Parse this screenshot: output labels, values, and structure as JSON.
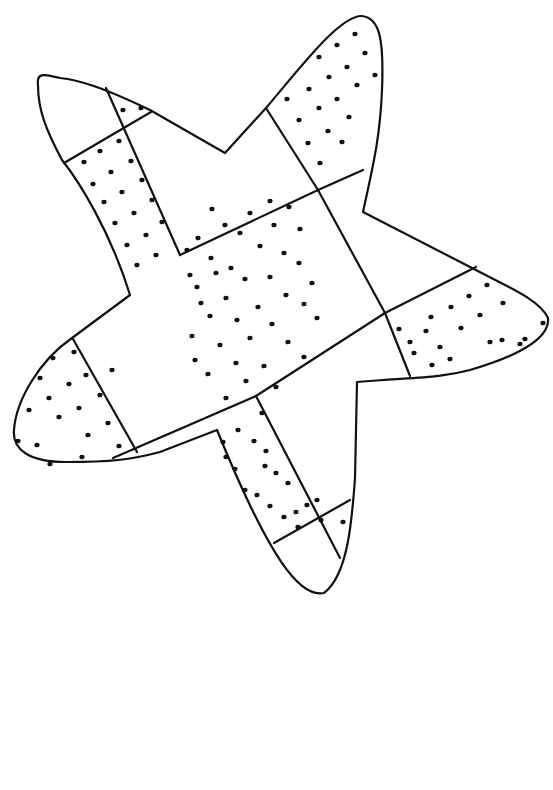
{
  "page": {
    "background": "#ffffff",
    "ink_color": "#111111",
    "width": 553,
    "height": 790
  },
  "drawing": {
    "subject": "star-shaped bandage coloring page",
    "outline": "M 38 85 C 36 70, 48 76, 60 78 C 78 80, 100 86, 150 110 L 225 153 L 266 108 C 300 68, 340 15, 362 16 C 380 18, 384 40, 382 90 C 380 140, 372 170, 363 212 L 472 268 C 510 288, 540 300, 548 318 C 550 336, 525 354, 470 370 C 440 378, 420 377, 357 382 L 355 478 C 352 520, 348 575, 324 593 C 300 598, 270 560, 217 430 L 160 452 C 130 460, 110 462, 66 462 C 30 462, 12 450, 14 430 C 16 400, 40 360, 72 338 L 130 295 C 110 230, 78 180, 62 160 C 46 130, 38 110, 38 85 Z",
    "segments": [
      "M 106 88 L 180 255",
      "M 64 163 L 151 112",
      "M 180 255 L 318 190",
      "M 318 190 L 363 170",
      "M 266 108 L 318 190",
      "M 318 190 L 385 313",
      "M 385 313 L 410 376",
      "M 385 313 L 476 267",
      "M 73 339 L 137 452",
      "M 113 458 L 256 396",
      "M 256 396 L 385 313",
      "M 256 396 L 340 558",
      "M 274 543 L 350 500"
    ],
    "dots": [
      [
        123,
        110
      ],
      [
        141,
        108
      ],
      [
        119,
        141
      ],
      [
        100,
        151
      ],
      [
        84,
        162
      ],
      [
        131,
        161
      ],
      [
        111,
        172
      ],
      [
        93,
        184
      ],
      [
        142,
        180
      ],
      [
        122,
        192
      ],
      [
        104,
        202
      ],
      [
        152,
        200
      ],
      [
        134,
        213
      ],
      [
        115,
        223
      ],
      [
        162,
        222
      ],
      [
        146,
        235
      ],
      [
        127,
        245
      ],
      [
        156,
        255
      ],
      [
        137,
        265
      ],
      [
        355,
        34
      ],
      [
        337,
        45
      ],
      [
        365,
        53
      ],
      [
        319,
        57
      ],
      [
        347,
        67
      ],
      [
        375,
        75
      ],
      [
        329,
        77
      ],
      [
        357,
        85
      ],
      [
        309,
        89
      ],
      [
        337,
        99
      ],
      [
        287,
        99
      ],
      [
        319,
        108
      ],
      [
        349,
        117
      ],
      [
        299,
        120
      ],
      [
        328,
        131
      ],
      [
        342,
        142
      ],
      [
        308,
        143
      ],
      [
        320,
        163
      ],
      [
        270,
        201
      ],
      [
        212,
        209
      ],
      [
        289,
        207
      ],
      [
        250,
        213
      ],
      [
        225,
        225
      ],
      [
        274,
        225
      ],
      [
        300,
        229
      ],
      [
        198,
        238
      ],
      [
        240,
        233
      ],
      [
        260,
        246
      ],
      [
        284,
        253
      ],
      [
        211,
        258
      ],
      [
        231,
        268
      ],
      [
        187,
        250
      ],
      [
        216,
        273
      ],
      [
        299,
        263
      ],
      [
        245,
        279
      ],
      [
        270,
        277
      ],
      [
        197,
        287
      ],
      [
        312,
        283
      ],
      [
        226,
        298
      ],
      [
        286,
        295
      ],
      [
        258,
        307
      ],
      [
        210,
        316
      ],
      [
        304,
        304
      ],
      [
        237,
        320
      ],
      [
        272,
        324
      ],
      [
        317,
        318
      ],
      [
        250,
        338
      ],
      [
        192,
        336
      ],
      [
        220,
        345
      ],
      [
        288,
        342
      ],
      [
        236,
        363
      ],
      [
        264,
        366
      ],
      [
        304,
        357
      ],
      [
        208,
        374
      ],
      [
        246,
        381
      ],
      [
        276,
        387
      ],
      [
        226,
        398
      ],
      [
        195,
        360
      ],
      [
        201,
        303
      ],
      [
        190,
        275
      ],
      [
        487,
        285
      ],
      [
        469,
        296
      ],
      [
        503,
        303
      ],
      [
        451,
        307
      ],
      [
        431,
        317
      ],
      [
        480,
        315
      ],
      [
        461,
        328
      ],
      [
        399,
        329
      ],
      [
        543,
        323
      ],
      [
        426,
        331
      ],
      [
        410,
        342
      ],
      [
        490,
        342
      ],
      [
        440,
        347
      ],
      [
        525,
        339
      ],
      [
        414,
        353
      ],
      [
        520,
        344
      ],
      [
        450,
        359
      ],
      [
        432,
        365
      ],
      [
        502,
        340
      ],
      [
        53,
        358
      ],
      [
        40,
        378
      ],
      [
        49,
        398
      ],
      [
        69,
        384
      ],
      [
        74,
        352
      ],
      [
        86,
        375
      ],
      [
        100,
        395
      ],
      [
        112,
        370
      ],
      [
        29,
        410
      ],
      [
        59,
        417
      ],
      [
        79,
        408
      ],
      [
        88,
        435
      ],
      [
        108,
        423
      ],
      [
        119,
        446
      ],
      [
        37,
        445
      ],
      [
        50,
        464
      ],
      [
        82,
        457
      ],
      [
        18,
        441
      ],
      [
        238,
        430
      ],
      [
        223,
        442
      ],
      [
        262,
        413
      ],
      [
        226,
        457
      ],
      [
        254,
        441
      ],
      [
        266,
        451
      ],
      [
        235,
        469
      ],
      [
        265,
        466
      ],
      [
        245,
        490
      ],
      [
        276,
        473
      ],
      [
        257,
        495
      ],
      [
        288,
        483
      ],
      [
        270,
        506
      ],
      [
        296,
        512
      ],
      [
        284,
        517
      ],
      [
        307,
        505
      ],
      [
        321,
        520
      ],
      [
        298,
        527
      ],
      [
        343,
        522
      ],
      [
        317,
        500
      ]
    ]
  }
}
